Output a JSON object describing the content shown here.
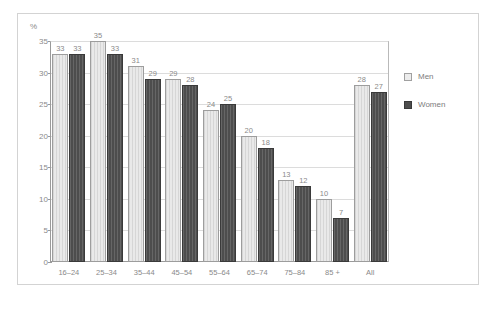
{
  "chart_data": {
    "type": "bar",
    "title": "",
    "subtitle": "",
    "xlabel": "",
    "ylabel": "%",
    "ylim": [
      0,
      35
    ],
    "yticks": [
      "0",
      "5",
      "10",
      "15",
      "20",
      "25",
      "30",
      "35"
    ],
    "ytick_values": [
      0,
      5,
      10,
      15,
      20,
      25,
      30,
      35
    ],
    "grid": true,
    "legend_position": "right",
    "categories": [
      "16–24",
      "25–34",
      "35–44",
      "45–54",
      "55–64",
      "65–74",
      "75–84",
      "85 +",
      "All"
    ],
    "series": [
      {
        "name": "Men",
        "color": "#e9e9e9",
        "values": [
          33,
          35,
          31,
          29,
          24,
          20,
          13,
          10,
          28
        ],
        "labels": [
          "33",
          "35",
          "31",
          "29",
          "24",
          "20",
          "13",
          "10",
          "28"
        ]
      },
      {
        "name": "Women",
        "color": "#4d4d4d",
        "values": [
          33,
          33,
          29,
          28,
          25,
          18,
          12,
          7,
          27
        ],
        "labels": [
          "33",
          "33",
          "29",
          "28",
          "25",
          "18",
          "12",
          "7",
          "27"
        ]
      }
    ]
  },
  "legend": {
    "items": [
      {
        "label": "Men",
        "swatch": "light-gray"
      },
      {
        "label": "Women",
        "swatch": "dark-gray"
      }
    ]
  },
  "axis": {
    "unit_label": "%"
  },
  "footer": {
    "caption": ""
  },
  "colors": {
    "men_bar": "#e9e9e9",
    "women_bar": "#4d4d4d",
    "gridline": "#dcdcdc",
    "axis": "#9a9a9a",
    "text": "#8a8a8a",
    "frame": "#d3d3d3",
    "background": "#ffffff"
  }
}
